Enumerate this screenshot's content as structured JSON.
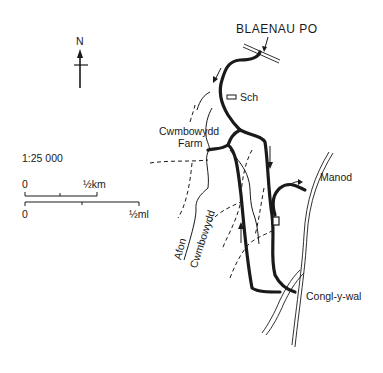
{
  "map": {
    "north_label": "N",
    "scale_text": "1:25 000",
    "scale_bar_km": {
      "start": "0",
      "end": "½km"
    },
    "scale_bar_mi": {
      "start": "0",
      "end": "½ml"
    },
    "places": {
      "blaenau": "BLAENAU PO",
      "school": "Sch",
      "farm_line1": "Cwmbowydd",
      "farm_line2": "Farm",
      "manod": "Manod",
      "congl": "Congl-y-wal"
    },
    "river": {
      "line1": "Afon",
      "line2": "Cwmbowydd"
    },
    "colors": {
      "ink": "#1a1a1a",
      "paper": "#ffffff"
    }
  }
}
